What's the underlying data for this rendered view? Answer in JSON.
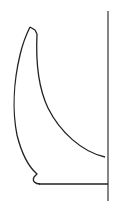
{
  "figure": {
    "type": "line-drawing",
    "stroke_color": "#222222",
    "background_color": "#ffffff",
    "stroke_width": 1.3
  },
  "elements": {
    "axis_line": {
      "x": 108,
      "y1": 11,
      "y2": 201
    },
    "base_line": {
      "x1": 40,
      "x2": 108,
      "y": 184
    },
    "outer_profile": "M30,27 L36,31 L37,35 C33,40 27,60 20,80 C12,110 17,140 37,174 L34,177 C33,181 36,184 40,184",
    "tip_left": "M30,27 C27,35 24,45 20,60",
    "inner_profile": "M37,35 C36,60 38,95 55,120 C70,142 88,156 106,157"
  }
}
